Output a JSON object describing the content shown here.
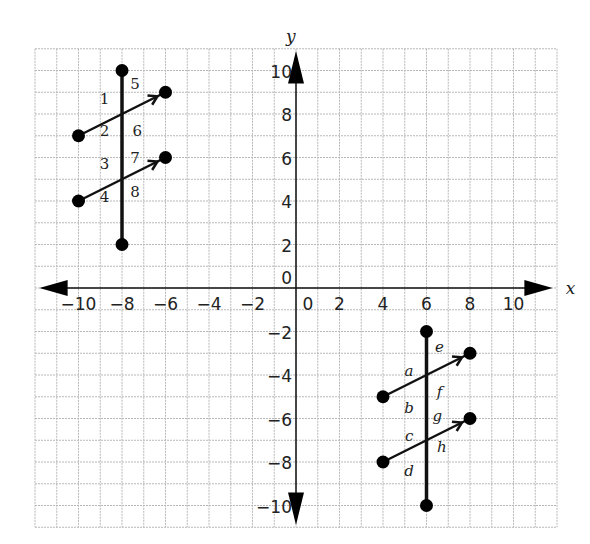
{
  "diagram": {
    "type": "coordinate-plane",
    "x_axis_label": "x",
    "y_axis_label": "y",
    "grid": {
      "x_min": -12,
      "x_max": 12,
      "y_min": -11,
      "y_max": 11,
      "step": 1
    },
    "x_ticks": [
      "-10",
      "-8",
      "-6",
      "-4",
      "-2",
      "0",
      "2",
      "4",
      "6",
      "8",
      "10"
    ],
    "y_ticks": [
      "10",
      "8",
      "6",
      "4",
      "2",
      "0",
      "-2",
      "-4",
      "-6",
      "-8",
      "-10"
    ],
    "figures": [
      {
        "name": "upper-left-transversal",
        "transversal": {
          "from": [
            -8,
            10
          ],
          "to": [
            -8,
            2
          ]
        },
        "rays": [
          {
            "from": [
              -10,
              7
            ],
            "to": [
              -6,
              9
            ]
          },
          {
            "from": [
              -10,
              4
            ],
            "to": [
              -6,
              6
            ]
          }
        ],
        "angle_labels": [
          {
            "text": "1",
            "at": [
              -8.8,
              8.7
            ]
          },
          {
            "text": "5",
            "at": [
              -7.4,
              9.4
            ]
          },
          {
            "text": "2",
            "at": [
              -8.8,
              7.2
            ]
          },
          {
            "text": "6",
            "at": [
              -7.3,
              7.2
            ]
          },
          {
            "text": "3",
            "at": [
              -8.8,
              5.7
            ]
          },
          {
            "text": "7",
            "at": [
              -7.4,
              6.0
            ]
          },
          {
            "text": "4",
            "at": [
              -8.8,
              4.2
            ]
          },
          {
            "text": "8",
            "at": [
              -7.4,
              4.4
            ]
          }
        ]
      },
      {
        "name": "lower-right-transversal",
        "transversal": {
          "from": [
            6,
            -2
          ],
          "to": [
            6,
            -10
          ]
        },
        "rays": [
          {
            "from": [
              4,
              -5
            ],
            "to": [
              8,
              -3
            ]
          },
          {
            "from": [
              4,
              -8
            ],
            "to": [
              8,
              -6
            ]
          }
        ],
        "angle_labels": [
          {
            "text": "a",
            "at": [
              5.2,
              -3.8
            ]
          },
          {
            "text": "e",
            "at": [
              6.6,
              -2.7
            ]
          },
          {
            "text": "b",
            "at": [
              5.2,
              -5.5
            ]
          },
          {
            "text": "f",
            "at": [
              6.6,
              -4.8
            ]
          },
          {
            "text": "g",
            "at": [
              6.5,
              -5.9
            ]
          },
          {
            "text": "c",
            "at": [
              5.2,
              -6.8
            ]
          },
          {
            "text": "h",
            "at": [
              6.7,
              -7.3
            ]
          },
          {
            "text": "d",
            "at": [
              5.2,
              -8.4
            ]
          }
        ]
      }
    ]
  }
}
